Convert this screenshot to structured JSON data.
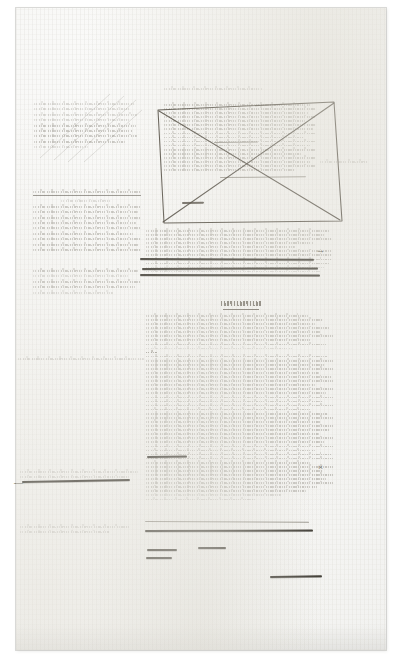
{
  "document": {
    "kind": "handwritten-manuscript-page",
    "script": "German Kurrent cursive",
    "medium": "brown iron-gall ink on laid paper",
    "legibility": "illegible at reproduction scale",
    "page_width": 409,
    "page_height": 666,
    "background_color": "#ffffff",
    "paper_color": "#f7f7f5",
    "ink_color": "#5c564a",
    "strike_color": "#3c362c"
  },
  "sheet": {
    "left": 16,
    "top": 8,
    "width": 370,
    "height": 642,
    "label": "manuscript-sheet"
  },
  "regions": [
    {
      "id": "top-blank",
      "label": "blank upper margin",
      "description": "empty paper above the writing, faint foxing specks only"
    },
    {
      "id": "left-column-upper",
      "label": "left column, upper paragraph",
      "description": "pale diagonally-shaded block of cancelled writing",
      "lines": 9
    },
    {
      "id": "left-column-mid",
      "label": "left column, underlined line plus paragraph",
      "lines": 11
    },
    {
      "id": "left-column-lower",
      "label": "left column, short closing paragraph",
      "lines": 5
    },
    {
      "id": "boxed-cancelled-passage",
      "label": "boxed and X-cancelled passage",
      "description": "dense paragraph framed by a hand-drawn quadrilateral and cancelled with two crossing diagonals",
      "lines": 17
    },
    {
      "id": "box-header",
      "label": "header line written above the box",
      "lines": 1
    },
    {
      "id": "right-margin-note",
      "label": "marginal note right of the box",
      "lines": 1
    },
    {
      "id": "middle-column",
      "label": "centre column paragraph with ruled strikethroughs",
      "lines": 9
    },
    {
      "id": "section-heading",
      "label": "underlined section heading",
      "text_rendered": "underlined single word"
    },
    {
      "id": "main-column",
      "label": "main lower column of running text",
      "lines": 46
    },
    {
      "id": "left-margin-note-1",
      "label": "isolated marginal line, left edge",
      "lines": 1
    },
    {
      "id": "left-margin-strike",
      "label": "heavily cancelled marginal entry, left edge",
      "lines": 2
    },
    {
      "id": "left-margin-note-2",
      "label": "two-line marginal note, lower left",
      "lines": 2
    }
  ],
  "annotations": {
    "cancellation_box": {
      "label": "quadrilateral deletion frame",
      "points": "4,4 162,0 168,112 8,112",
      "diagonals": 2
    },
    "strikethroughs": [
      {
        "label": "rule over middle column",
        "x": 140,
        "y": 258,
        "w": 172,
        "weight": "heavy"
      },
      {
        "label": "rule over middle column",
        "x": 142,
        "y": 268,
        "w": 172,
        "weight": "heavy"
      },
      {
        "label": "rule over middle column",
        "x": 140,
        "y": 274,
        "w": 176,
        "weight": "heavy"
      },
      {
        "label": "inline cancellation",
        "x": 148,
        "y": 456,
        "w": 38,
        "weight": "heavy"
      },
      {
        "label": "rule over main column",
        "x": 146,
        "y": 521,
        "w": 162,
        "weight": "light"
      },
      {
        "label": "rule over main column",
        "x": 146,
        "y": 530,
        "w": 166,
        "weight": "heavy"
      },
      {
        "label": "inline cancellation",
        "x": 148,
        "y": 549,
        "w": 28,
        "weight": "heavy"
      },
      {
        "label": "inline cancellation",
        "x": 198,
        "y": 547,
        "w": 26,
        "weight": "heavy"
      },
      {
        "label": "inline cancellation",
        "x": 146,
        "y": 557,
        "w": 26,
        "weight": "heavy"
      },
      {
        "label": "inline cancellation",
        "x": 272,
        "y": 576,
        "w": 48,
        "weight": "heavy"
      },
      {
        "label": "margin cancellation",
        "x": 22,
        "y": 481,
        "w": 104,
        "weight": "heavy"
      },
      {
        "label": "inline cancellation inside box",
        "x": 196,
        "y": 135,
        "w": 38,
        "weight": "light"
      },
      {
        "label": "arrowed insertion stroke",
        "x": 203,
        "y": 170,
        "w": 84,
        "weight": "light"
      }
    ],
    "marks": [
      {
        "label": "caret",
        "glyph": "←",
        "x": 318,
        "y": 246
      },
      {
        "label": "cross mark",
        "glyph": "×",
        "x": 320,
        "y": 468
      },
      {
        "label": "insert mark",
        "glyph": "—",
        "x": 5,
        "y": 484
      }
    ]
  }
}
